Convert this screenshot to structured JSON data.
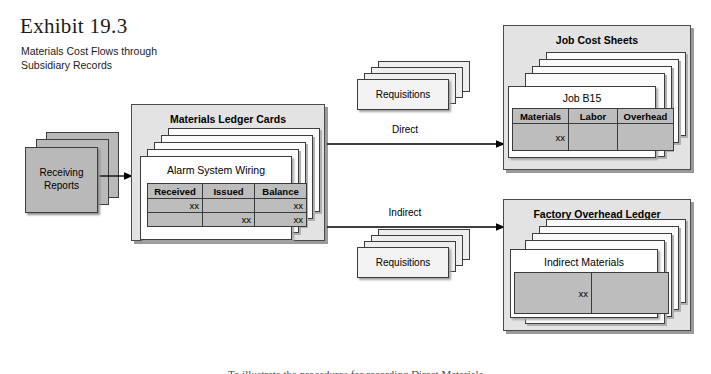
{
  "exhibit": {
    "number": "Exhibit 19.3",
    "subtitle_line1": "Materials Cost Flows through",
    "subtitle_line2": "Subsidiary Records"
  },
  "receiving_reports": {
    "label_line1": "Receiving",
    "label_line2": "Reports"
  },
  "materials_ledger": {
    "group_title": "Materials Ledger Cards",
    "card_title": "Alarm System Wiring",
    "columns": [
      "Received",
      "Issued",
      "Balance"
    ],
    "rows": [
      [
        "xx",
        "",
        "xx"
      ],
      [
        "",
        "xx",
        "xx"
      ]
    ]
  },
  "requisitions_direct": {
    "label": "Requisitions",
    "flow_label": "Direct"
  },
  "requisitions_indirect": {
    "label": "Requisitions",
    "flow_label": "Indirect"
  },
  "job_cost_sheets": {
    "group_title": "Job Cost Sheets",
    "sheet_title": "Job B15",
    "columns": [
      "Materials",
      "Labor",
      "Overhead"
    ],
    "rows": [
      [
        "xx",
        "",
        ""
      ]
    ]
  },
  "factory_overhead_ledger": {
    "group_title": "Factory Overhead Ledger",
    "sheet_title": "Indirect Materials",
    "rows": [
      [
        "xx",
        ""
      ]
    ]
  },
  "bottom_caption": {
    "text": "To illustrate the procedures for recording Direct Materials"
  },
  "colors": {
    "page_background": "#ffffff",
    "group_fill": "#e3e3e3",
    "sheet_fill": "#ffffff",
    "table_cell_fill": "#bdbdbd",
    "gray_doc_fill": "#b9b9b9",
    "slip_fill": "#f3f3f3",
    "border": "#3d3d3d",
    "shadow": "#9a9a9a",
    "text": "#000000"
  }
}
